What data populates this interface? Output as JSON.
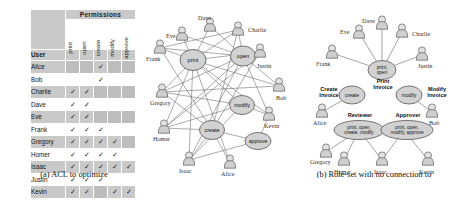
{
  "figure": {
    "captions": {
      "a": "(a) ACL to optimize",
      "b": "(b) Role-set with no connection to",
      "c": "(c) Role-set that reflects busi-"
    }
  },
  "acl_table": {
    "group_header": "Permissions",
    "user_header": "User",
    "permissions": [
      "print",
      "open",
      "create",
      "modify",
      "approve"
    ],
    "check_mark": "✓",
    "rows": [
      {
        "user": "Alice",
        "perms": [
          false,
          false,
          true,
          false,
          false
        ]
      },
      {
        "user": "Bob",
        "perms": [
          false,
          false,
          true,
          false,
          false
        ]
      },
      {
        "user": "Charlie",
        "perms": [
          true,
          true,
          false,
          false,
          false
        ]
      },
      {
        "user": "Dave",
        "perms": [
          true,
          true,
          false,
          false,
          false
        ]
      },
      {
        "user": "Eve",
        "perms": [
          true,
          true,
          false,
          false,
          false
        ]
      },
      {
        "user": "Frank",
        "perms": [
          true,
          true,
          true,
          false,
          false
        ]
      },
      {
        "user": "Gregory",
        "perms": [
          true,
          true,
          true,
          true,
          false
        ]
      },
      {
        "user": "Homer",
        "perms": [
          true,
          true,
          true,
          true,
          false
        ]
      },
      {
        "user": "Isaac",
        "perms": [
          true,
          true,
          true,
          true,
          true
        ]
      },
      {
        "user": "Justin",
        "perms": [
          true,
          true,
          true,
          false,
          false
        ]
      },
      {
        "user": "Kevin",
        "perms": [
          true,
          true,
          false,
          true,
          true
        ]
      }
    ]
  },
  "diagram_b": {
    "title_ref": "b",
    "permission_nodes": [
      {
        "id": "print",
        "label": "print"
      },
      {
        "id": "open",
        "label": "open"
      },
      {
        "id": "modify",
        "label": "modify"
      },
      {
        "id": "create",
        "label": "create"
      },
      {
        "id": "approve",
        "label": "approve"
      }
    ],
    "users": [
      {
        "name": "Eve"
      },
      {
        "name": "Dave"
      },
      {
        "name": "Charlie"
      },
      {
        "name": "Frank"
      },
      {
        "name": "Justin"
      },
      {
        "name": "Gregory"
      },
      {
        "name": "Bob"
      },
      {
        "name": "Kevin"
      },
      {
        "name": "Homer"
      },
      {
        "name": "Isaac"
      },
      {
        "name": "Alice"
      }
    ]
  },
  "diagram_c": {
    "title_ref": "c",
    "roles": [
      {
        "id": "print-invoice",
        "role_name": "Print Invoice",
        "perms_text": "print,\nopen"
      },
      {
        "id": "create-invoice",
        "role_name": "Create Invoice",
        "perms_text": "create"
      },
      {
        "id": "modify-invoice",
        "role_name": "Modify Invoice",
        "perms_text": "modify"
      },
      {
        "id": "reviewer",
        "role_name": "Reviewer",
        "perms_text": "print, open,\ncreate, modify"
      },
      {
        "id": "approver",
        "role_name": "Approver",
        "perms_text": "print, open,\nmodify, approve"
      }
    ],
    "role_labels": {
      "print_invoice": "Print\nInvoice",
      "create_invoice": "Create\nInvoice",
      "modify_invoice": "Modify\nInvoice",
      "reviewer": "Reviewer",
      "approver": "Approver"
    },
    "role_perm_lines": {
      "print_invoice_1": "print,",
      "print_invoice_2": "open",
      "create_invoice": "create",
      "modify_invoice": "modify",
      "reviewer_1": "print, open,",
      "reviewer_2": "create, modify",
      "approver_1": "print, open,",
      "approver_2": "modify, approve"
    },
    "users": [
      {
        "name": "Dave"
      },
      {
        "name": "Eve"
      },
      {
        "name": "Charlie"
      },
      {
        "name": "Frank"
      },
      {
        "name": "Justin"
      },
      {
        "name": "Alice"
      },
      {
        "name": "Bob"
      },
      {
        "name": "Gregory"
      },
      {
        "name": "Homer"
      },
      {
        "name": "Isaac"
      },
      {
        "name": "Kevin"
      }
    ]
  },
  "colors": {
    "table_shade": "#c9c9c9",
    "cell_empty": "#bdbdbd",
    "node_fill": "#d6d6d6",
    "stroke": "#555555",
    "background": "#ffffff"
  }
}
